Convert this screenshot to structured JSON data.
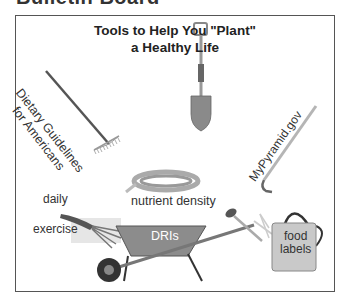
{
  "page": {
    "heading": "Bulletin Board"
  },
  "board": {
    "title_line1": "Tools to Help You \"Plant\"",
    "title_line2": "a Healthy Life"
  },
  "tools": [
    {
      "tool": "rake",
      "label_line1": "Dietary Guidelines",
      "label_line2": "for Americans"
    },
    {
      "tool": "shovel",
      "label": ""
    },
    {
      "tool": "hoe",
      "label": "MyPyramid.gov"
    },
    {
      "tool": "hand-cultivator",
      "label_line1": "daily",
      "label_line2": "exercise"
    },
    {
      "tool": "garden-hose",
      "label": "nutrient density"
    },
    {
      "tool": "wheelbarrow",
      "label": "DRIs"
    },
    {
      "tool": "watering-can",
      "label_line1": "food",
      "label_line2": "labels"
    }
  ],
  "colors": {
    "border": "#555555",
    "tool_gray": "#9a9a9a",
    "tool_dark": "#3a3a3a",
    "tool_light": "#cfcfcf"
  }
}
